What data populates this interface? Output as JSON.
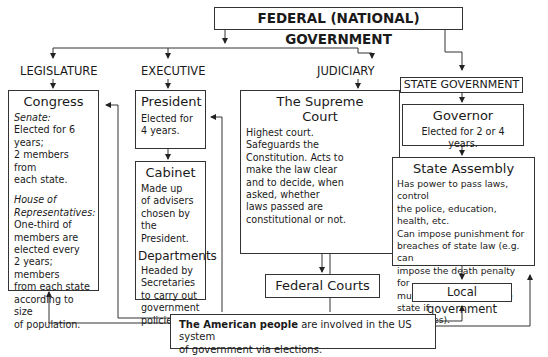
{
  "header": {
    "title": "FEDERAL (NATIONAL) GOVERNMENT"
  },
  "branches": {
    "legislature": "LEGISLATURE",
    "executive": "EXECUTIVE",
    "judiciary": "JUDICIARY",
    "state": "STATE GOVERNMENT"
  },
  "congress": {
    "title": "Congress",
    "senate_label": "Senate:",
    "senate_lines": [
      "Elected for 6",
      "years;",
      "2 members from",
      "each state."
    ],
    "house_label_lines": [
      "House of",
      "Representatives:"
    ],
    "house_lines": [
      "One-third of",
      "members are",
      "elected every",
      "2 years; members",
      "from each state",
      "according to size",
      "of population."
    ]
  },
  "president": {
    "title": "President",
    "lines": [
      "Elected for",
      "4 years."
    ]
  },
  "cabinet": {
    "title": "Cabinet",
    "lines": [
      "Made up",
      "of advisers",
      "chosen by",
      "the President."
    ],
    "departments_title": "Departments",
    "departments_lines": [
      "Headed by",
      "Secretaries",
      "to carry out",
      "government",
      "policies."
    ]
  },
  "supreme_court": {
    "title_lines": [
      "The Supreme",
      "Court"
    ],
    "lines": [
      "Highest court.",
      "Safeguards the",
      "Constitution. Acts to",
      "make the law clear",
      "and to decide, when",
      "asked, whether",
      "laws passed are",
      "constitutional or not."
    ]
  },
  "federal_courts": {
    "title": "Federal Courts"
  },
  "governor": {
    "title": "Governor",
    "lines": [
      "Elected for 2 or 4 years."
    ]
  },
  "state_assembly": {
    "title": "State Assembly",
    "lines": [
      "Has power to pass laws, control",
      "the police, education, health, etc.",
      "Can impose punishment for",
      "breaches of state law (e.g. can",
      "impose the death penalty for",
      "murder committed in the state if",
      "it chooses)."
    ]
  },
  "local_government": {
    "title": "Local government"
  },
  "people": {
    "bold": "The American people",
    "rest_line1": " are involved in the US system",
    "line2": "of government via elections."
  }
}
